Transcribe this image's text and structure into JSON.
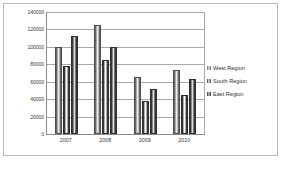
{
  "chart_data": {
    "type": "bar",
    "title": "",
    "subtitle": "",
    "xlabel": "",
    "ylabel": "",
    "categories": [
      "2007",
      "2008",
      "2009",
      "2010"
    ],
    "series": [
      {
        "name": "West Region",
        "values": [
          100000,
          125000,
          65000,
          73000
        ]
      },
      {
        "name": "South Region",
        "values": [
          78000,
          85000,
          38000,
          45000
        ]
      },
      {
        "name": "East Region",
        "values": [
          112000,
          100000,
          52000,
          63000
        ]
      }
    ],
    "ylim": [
      0,
      140000
    ],
    "ytick_labels": [
      "0",
      "20000",
      "40000",
      "60000",
      "80000",
      "100000",
      "120000",
      "140000"
    ],
    "ytick_values": [
      0,
      20000,
      40000,
      60000,
      80000,
      100000,
      120000,
      140000
    ],
    "grid": true,
    "legend_position": "right",
    "annotations": []
  },
  "legend": {
    "items": [
      {
        "label": "West Region"
      },
      {
        "label": "South Region"
      },
      {
        "label": "East Region"
      }
    ]
  }
}
